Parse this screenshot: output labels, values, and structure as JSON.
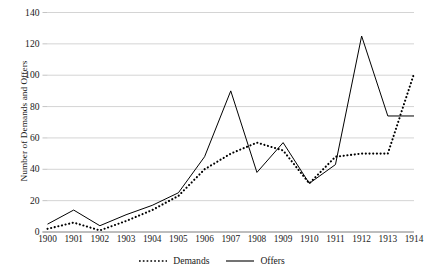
{
  "chart_data": {
    "type": "line",
    "title": "",
    "xlabel": "",
    "ylabel": "Number of Demands and Offers",
    "categories": [
      "1900",
      "1901",
      "1902",
      "1903",
      "1904",
      "1905",
      "1906",
      "1907",
      "1908",
      "1909",
      "1910",
      "1911",
      "1912",
      "1913",
      "1914"
    ],
    "yticks": [
      0,
      20,
      40,
      60,
      80,
      100,
      120,
      140
    ],
    "ylim": [
      0,
      140
    ],
    "grid": true,
    "legend_position": "bottom",
    "series": [
      {
        "name": "Demands",
        "style": "dotted",
        "color": "#000000",
        "values": [
          2,
          6,
          1,
          7,
          14,
          23,
          40,
          50,
          57,
          52,
          31,
          48,
          50,
          50,
          101
        ]
      },
      {
        "name": "Offers",
        "style": "solid",
        "color": "#000000",
        "values": [
          5,
          14,
          4,
          11,
          17,
          25,
          48,
          90,
          38,
          57,
          31,
          43,
          125,
          74,
          74
        ]
      }
    ]
  },
  "legend": {
    "items": [
      {
        "label": "Demands",
        "style": "dotted"
      },
      {
        "label": "Offers",
        "style": "solid"
      }
    ]
  }
}
